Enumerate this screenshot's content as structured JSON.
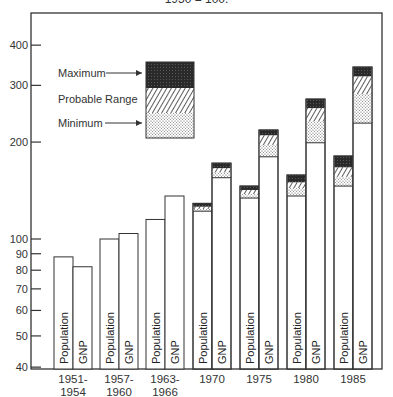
{
  "chart_data": {
    "type": "bar",
    "title": "1950 = 100.",
    "xlabel": "",
    "ylabel": "",
    "yscale": "log",
    "ylim": [
      40,
      460
    ],
    "yticks": [
      40,
      50,
      60,
      70,
      80,
      90,
      100,
      200,
      300,
      400
    ],
    "grid": false,
    "categories": [
      "1951-\n1954",
      "1957-\n1960",
      "1963-\n1966",
      "1970",
      "1975",
      "1980",
      "1985"
    ],
    "category_lines": [
      [
        "1951-",
        "1954"
      ],
      [
        "1957-",
        "1960"
      ],
      [
        "1963-",
        "1966"
      ],
      [
        "1970"
      ],
      [
        "1975"
      ],
      [
        "1980"
      ],
      [
        "1985"
      ]
    ],
    "bar_labels": [
      "Population",
      "GNP"
    ],
    "series": [
      {
        "name": "Population",
        "values": [
          88,
          100,
          115,
          122,
          134,
          136,
          146
        ],
        "projection": [
          null,
          null,
          null,
          {
            "minimum": 122,
            "min_top": 124,
            "probable_top": 126,
            "maximum": 129
          },
          {
            "minimum": 134,
            "min_top": 138,
            "probable_top": 142,
            "maximum": 146
          },
          {
            "minimum": 136,
            "min_top": 144,
            "probable_top": 150,
            "maximum": 158
          },
          {
            "minimum": 146,
            "min_top": 156,
            "probable_top": 167,
            "maximum": 181
          }
        ]
      },
      {
        "name": "GNP",
        "values": [
          82,
          104,
          136,
          155,
          180,
          199,
          229
        ],
        "projection": [
          null,
          null,
          null,
          {
            "minimum": 155,
            "min_top": 161,
            "probable_top": 166,
            "maximum": 172
          },
          {
            "minimum": 180,
            "min_top": 196,
            "probable_top": 210,
            "maximum": 218
          },
          {
            "minimum": 199,
            "min_top": 232,
            "probable_top": 255,
            "maximum": 272
          },
          {
            "minimum": 229,
            "min_top": 282,
            "probable_top": 320,
            "maximum": 342
          }
        ]
      }
    ],
    "legend": {
      "position": "upper-left",
      "entries": [
        "Maximum",
        "Probable Range",
        "Minimum"
      ]
    }
  },
  "colors": {
    "axis": "#333333",
    "bar_fill": "#ffffff",
    "maximum_fill": "#2a2a2a",
    "hatch": "#333333",
    "dots": "#666666"
  }
}
